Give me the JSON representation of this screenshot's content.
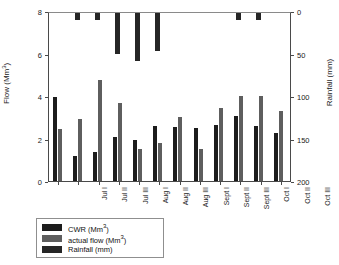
{
  "chart_data": {
    "type": "bar",
    "title": "",
    "subtitle": "",
    "xlabel": "",
    "ylabel": "Flow (Mm3)",
    "ylabel_display": "Flow (Mm",
    "ylabel_sup": "3",
    "ylabel_tail": ")",
    "y2label_display": "Rainfall (mm)",
    "categories": [
      "Jul I",
      "Jul II",
      "Jul III",
      "Aug I",
      "Aug II",
      "Aug III",
      "Sept I",
      "Sept II",
      "Sept III",
      "Oct I",
      "Oct II",
      "Oct III"
    ],
    "ylim": [
      0,
      8
    ],
    "yticks": [
      0,
      2,
      4,
      6,
      8
    ],
    "ytick_labels": [
      "0",
      "2",
      "4",
      "6",
      "8"
    ],
    "y2lim": [
      0,
      200
    ],
    "y2_inverted": true,
    "y2ticks": [
      0,
      50,
      100,
      150,
      200
    ],
    "y2tick_labels": [
      "0",
      "50",
      "100",
      "150",
      "200"
    ],
    "grid": false,
    "legend_position": "below-left",
    "series": [
      {
        "name": "CWR (Mm3)",
        "label_main": "CWR (Mm",
        "label_sup": "3",
        "label_tail": ")",
        "axis": "left",
        "color": "#1c1c1c",
        "values": [
          3.95,
          1.2,
          1.35,
          2.05,
          1.95,
          2.6,
          2.55,
          2.5,
          2.65,
          3.05,
          2.6,
          2.25
        ]
      },
      {
        "name": "actual flow (Mm3)",
        "label_main": "actual flow (Mm",
        "label_sup": "3",
        "label_tail": ")",
        "axis": "left",
        "color": "#5e5e5e",
        "values": [
          2.45,
          2.9,
          4.75,
          3.65,
          1.5,
          1.8,
          3.0,
          1.5,
          3.45,
          4.0,
          4.0,
          3.3
        ]
      },
      {
        "name": "Rainfall (mm)",
        "label_main": "Rainfall (mm)",
        "label_sup": "",
        "label_tail": "",
        "axis": "right",
        "color": "#262626",
        "values": [
          0,
          8,
          8,
          48,
          57,
          45,
          0,
          0,
          0,
          8,
          8,
          0
        ]
      }
    ]
  }
}
